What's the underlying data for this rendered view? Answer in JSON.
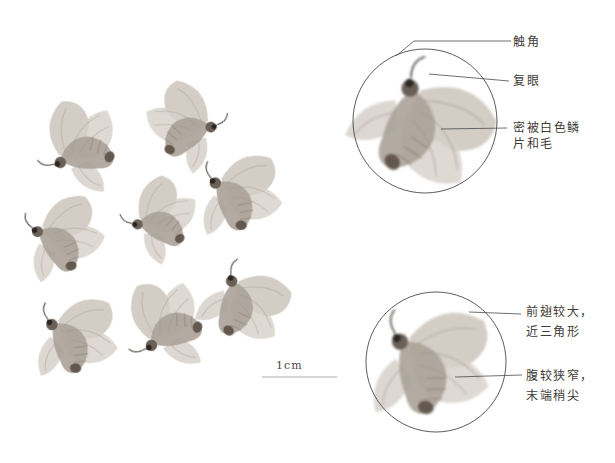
{
  "figure": {
    "type": "annotated-specimen-plate",
    "illustration": {
      "kind": "moth-specimen-watercolor",
      "main_cluster_specimen_count": 8,
      "detail_inset_count": 2
    },
    "scale_bar": {
      "label": "1cm"
    },
    "detail_circles": [
      {
        "position": "top-right",
        "annotations": [
          {
            "text": "触角"
          },
          {
            "text": "复眼"
          },
          {
            "text_lines": [
              "密被白色鳞",
              "片和毛"
            ]
          }
        ]
      },
      {
        "position": "bottom-right",
        "annotations": [
          {
            "text_lines": [
              "前翅较大，",
              "近三角形"
            ]
          },
          {
            "text_lines": [
              "腹较狭窄，",
              "末端稍尖"
            ]
          }
        ]
      }
    ],
    "colors": {
      "background": "#ffffff",
      "ink": "#3f3b38",
      "leader": "#4a4a4a",
      "circle": "#4a4a4a",
      "scale_line": "#adadad",
      "wing_light": "#d6d0c8",
      "wing_mid": "#c8c1b8",
      "body": "#aba298",
      "dark_accent": "#40372f"
    }
  }
}
